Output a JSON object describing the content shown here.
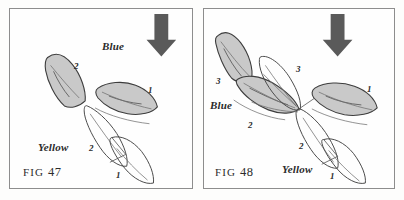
{
  "figure": {
    "caption_style": "two-panel sailing tactics diagram",
    "wind_arrow_icon": "down-arrow-icon"
  },
  "panels": [
    {
      "id": "fig47",
      "fig_label_prefix": "FIG",
      "fig_label_number": "47",
      "team_labels": {
        "blue": "Blue",
        "yellow": "Yellow"
      },
      "boat_numbers": {
        "blue": [
          "2",
          "1"
        ],
        "yellow": [
          "2",
          "1"
        ]
      }
    },
    {
      "id": "fig48",
      "fig_label_prefix": "FIG",
      "fig_label_number": "48",
      "team_labels": {
        "blue": "Blue",
        "yellow": "Yellow"
      },
      "boat_numbers": {
        "blue": [
          "3",
          "2",
          "1"
        ],
        "yellow": [
          "3",
          "2",
          "1"
        ]
      }
    }
  ],
  "colors": {
    "blue_boat_fill": "#c9c9c9",
    "blue_boat_stroke": "#3d3d3d",
    "yellow_boat_stroke": "#4a4a4a",
    "arrow": "#5a5a5a",
    "panel_border": "#8d8d8d",
    "background": "#fefefe",
    "text": "#2b2b2b"
  }
}
